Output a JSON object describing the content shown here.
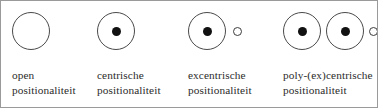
{
  "figure": {
    "border_color": "#9a9a9a",
    "background": "#ffffff",
    "stroke_color": "#4a4a4a",
    "fill_color": "#111111"
  },
  "panels": [
    {
      "id": "open",
      "caption": "open\npositionaliteit",
      "symbol": {
        "big_circles": 1,
        "filled_dots": 0,
        "satellite_circles": 0
      }
    },
    {
      "id": "centrische",
      "caption": "centrische\npositionaliteit",
      "symbol": {
        "big_circles": 1,
        "filled_dots": 1,
        "satellite_circles": 0
      }
    },
    {
      "id": "excentrische",
      "caption": "excentrische\npositionaliteit",
      "symbol": {
        "big_circles": 1,
        "filled_dots": 1,
        "satellite_circles": 1
      }
    },
    {
      "id": "poly-excentrische",
      "caption": "poly-(ex)centrische\npositionaliteit",
      "symbol": {
        "big_circles": 2,
        "filled_dots": 2,
        "satellite_circles": 1
      }
    }
  ]
}
